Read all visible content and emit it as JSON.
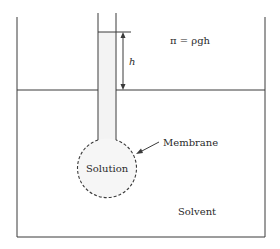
{
  "diagram": {
    "labels": {
      "equation": "π = ρgh",
      "height": "h",
      "membrane": "Membrane",
      "solution": "Solution",
      "solvent": "Solvent"
    },
    "colors": {
      "line": "#3a3a3a",
      "tube_fill": "#f3f3f3",
      "background": "#ffffff"
    }
  }
}
